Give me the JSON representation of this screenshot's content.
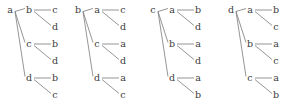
{
  "figure": {
    "type": "tree-diagram-set",
    "background_color": "#ffffff",
    "line_color": "#7a7a7a",
    "text_color": "#3b3b3b"
  },
  "layout": {
    "width": 297,
    "height": 106,
    "tree_origins_x": [
      10,
      78,
      153,
      231
    ],
    "level_x_offsets": [
      0,
      19,
      45
    ],
    "row_y": [
      10,
      27,
      44,
      61,
      78,
      95
    ],
    "root_row_index": 0,
    "branch_row_indices": [
      0,
      2,
      4
    ]
  },
  "trees": [
    {
      "index": 0,
      "root": "a",
      "branches": [
        {
          "label": "b",
          "leaves": [
            "c",
            "d"
          ]
        },
        {
          "label": "c",
          "leaves": [
            "b",
            "d"
          ]
        },
        {
          "label": "d",
          "leaves": [
            "b",
            "c"
          ]
        }
      ]
    },
    {
      "index": 1,
      "root": "b",
      "branches": [
        {
          "label": "a",
          "leaves": [
            "c",
            "d"
          ]
        },
        {
          "label": "c",
          "leaves": [
            "a",
            "d"
          ]
        },
        {
          "label": "d",
          "leaves": [
            "a",
            "c"
          ]
        }
      ]
    },
    {
      "index": 2,
      "root": "c",
      "branches": [
        {
          "label": "a",
          "leaves": [
            "b",
            "d"
          ]
        },
        {
          "label": "b",
          "leaves": [
            "a",
            "d"
          ]
        },
        {
          "label": "d",
          "leaves": [
            "a",
            "b"
          ]
        }
      ]
    },
    {
      "index": 3,
      "root": "d",
      "branches": [
        {
          "label": "a",
          "leaves": [
            "b",
            "c"
          ]
        },
        {
          "label": "b",
          "leaves": [
            "a",
            "c"
          ]
        },
        {
          "label": "c",
          "leaves": [
            "a",
            "b"
          ]
        }
      ]
    }
  ]
}
